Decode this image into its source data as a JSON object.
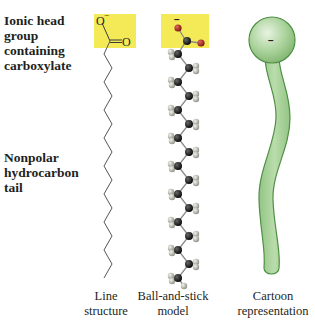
{
  "labels": {
    "head_group": [
      "Ionic head",
      "group",
      "containing",
      "carboxylate"
    ],
    "tail": [
      "Nonpolar",
      "hydrocarbon",
      "tail"
    ]
  },
  "captions": {
    "line": [
      "Line",
      "structure"
    ],
    "ball_stick": [
      "Ball-and-stick",
      "model"
    ],
    "cartoon": [
      "Cartoon",
      "representation"
    ]
  },
  "line_structure": {
    "atom_o_minus": "O",
    "charge_minus": "−",
    "atom_o_double": "O"
  },
  "ball_stick": {
    "charge_minus": "−"
  },
  "cartoon": {
    "charge_minus": "−"
  },
  "colors": {
    "highlight": "#f4ea58",
    "oxygen": "#b5261e",
    "carbon": "#111111",
    "hydrogen": "#c9cabf",
    "bond": "#7a7a7a",
    "cartoon_fill": "#a9d19a",
    "cartoon_stroke": "#4f8f45",
    "text": "#231f20"
  }
}
